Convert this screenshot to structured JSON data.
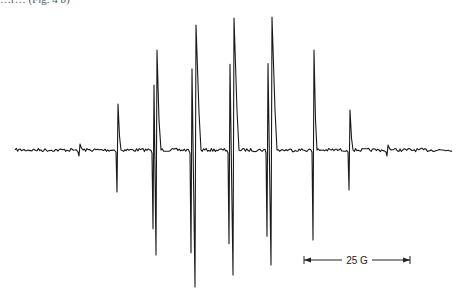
{
  "caption_fragment": "…r… (Fig. 4 b)",
  "chart_data": {
    "type": "line",
    "xlabel": "",
    "ylabel": "",
    "grid": false,
    "legend": "none",
    "baseline_y_px": 150,
    "x_range_px": [
      15,
      452
    ],
    "scale_bar": {
      "label": "25 G",
      "x1_px": 304,
      "x2_px": 410,
      "y_px": 260
    },
    "lines": [
      {
        "x": 80,
        "up": 144,
        "down": 156,
        "note": "weak outer line"
      },
      {
        "x": 118,
        "up": 104,
        "down": 192
      },
      {
        "x": 156,
        "up": 50,
        "down": 255,
        "split": 3
      },
      {
        "x": 195,
        "up": 25,
        "down": 287,
        "split": 4
      },
      {
        "x": 233,
        "up": 18,
        "down": 275,
        "split": 4
      },
      {
        "x": 271,
        "up": 17,
        "down": 265,
        "split": 4
      },
      {
        "x": 314,
        "up": 50,
        "down": 240
      },
      {
        "x": 350,
        "up": 110,
        "down": 190
      },
      {
        "x": 388,
        "up": 145,
        "down": 156,
        "note": "weak outer line"
      }
    ]
  }
}
